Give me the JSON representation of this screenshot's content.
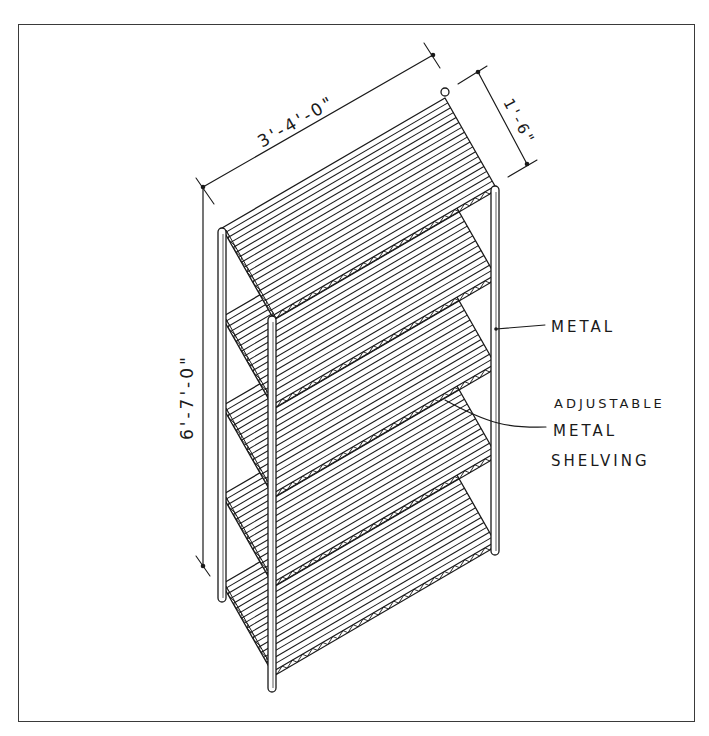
{
  "drawing": {
    "title": "Adjustable metal shelving unit - isometric sketch",
    "shelf_count": 5,
    "ink_color": "#1a1a1a",
    "frame_color": "#3a3a3a"
  },
  "dimensions": {
    "width": "3'-4'-0\"",
    "depth": "1'-6\"",
    "height": "6'-7'-0\""
  },
  "callouts": {
    "posts": "METAL",
    "shelving_line1": "ADJUSTABLE",
    "shelving_line2": "METAL",
    "shelving_line3": "SHELVING"
  }
}
